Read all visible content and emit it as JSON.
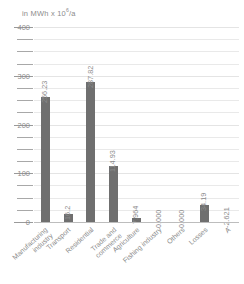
{
  "chart_data": {
    "type": "bar",
    "title": "",
    "ylabel": "in MWh x 10⁶/a",
    "xlabel": "",
    "ylim": [
      0,
      400
    ],
    "grid": true,
    "legend": false,
    "y_ticks": [
      "400",
      "300",
      "200",
      "100",
      "0"
    ],
    "y_tick_values": [
      400,
      300,
      200,
      100,
      0
    ],
    "minor_tick_step": 25,
    "categories": [
      "Manufacturing industry",
      "Transport",
      "Residential",
      "Trade and commerce",
      "Agriculture",
      "Fishing industry",
      "Others",
      "Losses",
      "A"
    ],
    "category_lines": [
      [
        "Manufacturing",
        "industry"
      ],
      [
        "Transport"
      ],
      [
        "Residential"
      ],
      [
        "Trade and",
        "commerce"
      ],
      [
        "Agriculture"
      ],
      [
        "Fishing industry"
      ],
      [
        "Others"
      ],
      [
        "Losses"
      ],
      [
        "A"
      ]
    ],
    "values": [
      256.23,
      16.2,
      287.82,
      114.93,
      7.964,
      0.0,
      0.0,
      34.19,
      -2.621
    ],
    "value_labels": [
      "256.23",
      "16.2",
      "287.82",
      "114.93",
      "7.964",
      "0.000",
      "0.000",
      "34.19",
      "-2.621"
    ],
    "bar_color": "#6f6f6f",
    "grid_color": "#e9e9e9",
    "text_color": "#8c8c8c"
  }
}
